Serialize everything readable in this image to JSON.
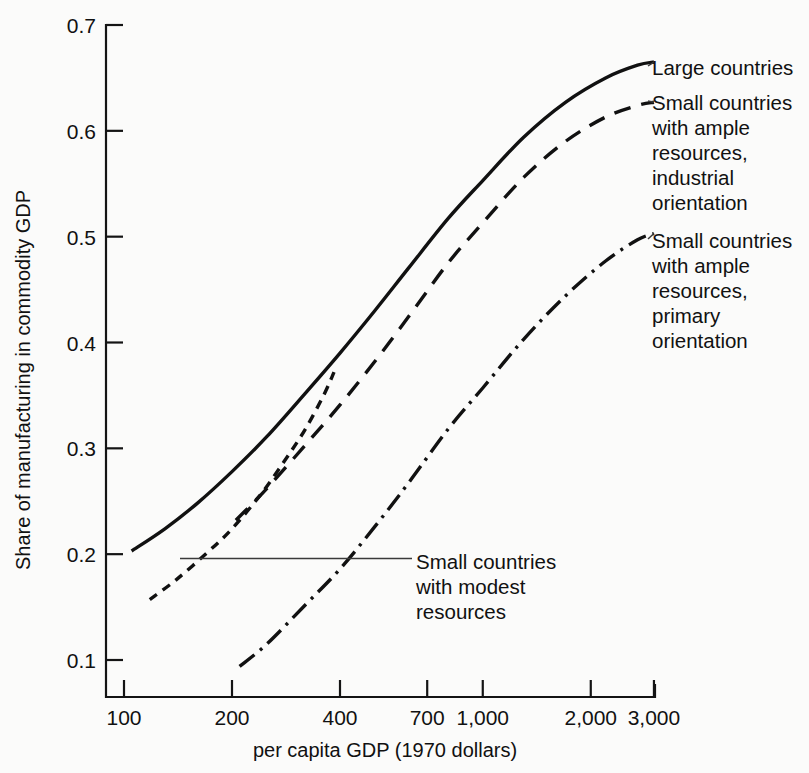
{
  "chart_data": {
    "type": "line",
    "title": "",
    "xlabel": "per capita GDP (1970 dollars)",
    "ylabel": "Share of manufacturing in commodity GDP",
    "xscale": "log",
    "xlim": [
      95,
      3200
    ],
    "ylim": [
      0.07,
      0.715
    ],
    "grid": false,
    "legend_position": "right-inline",
    "xticks": [
      {
        "value": 100,
        "label": "100"
      },
      {
        "value": 200,
        "label": "200"
      },
      {
        "value": 400,
        "label": "400"
      },
      {
        "value": 700,
        "label": "700"
      },
      {
        "value": 1000,
        "label": "1,000"
      },
      {
        "value": 2000,
        "label": "2,000"
      },
      {
        "value": 3000,
        "label": "3,000"
      }
    ],
    "yticks": [
      {
        "value": 0.1,
        "label": "0.1"
      },
      {
        "value": 0.2,
        "label": "0.2"
      },
      {
        "value": 0.3,
        "label": "0.3"
      },
      {
        "value": 0.4,
        "label": "0.4"
      },
      {
        "value": 0.5,
        "label": "0.5"
      },
      {
        "value": 0.6,
        "label": "0.6"
      },
      {
        "value": 0.7,
        "label": "0.7"
      }
    ],
    "series": [
      {
        "name": "Large countries",
        "style": "solid",
        "dasharray": "",
        "x": [
          105,
          130,
          160,
          200,
          250,
          320,
          400,
          500,
          620,
          800,
          1000,
          1300,
          1700,
          2200,
          2700,
          3000
        ],
        "y": [
          0.203,
          0.224,
          0.248,
          0.278,
          0.311,
          0.352,
          0.39,
          0.43,
          0.47,
          0.517,
          0.553,
          0.594,
          0.627,
          0.65,
          0.662,
          0.665
        ]
      },
      {
        "name": "Small countries with ample resources, industrial orientation",
        "style": "long-dash",
        "dasharray": "17 11",
        "x": [
          205,
          250,
          320,
          400,
          500,
          620,
          800,
          1000,
          1300,
          1700,
          2200,
          2700,
          3000
        ],
        "y": [
          0.232,
          0.262,
          0.303,
          0.341,
          0.382,
          0.424,
          0.475,
          0.513,
          0.556,
          0.59,
          0.613,
          0.624,
          0.627
        ]
      },
      {
        "name": "Small countries with modest resources",
        "style": "short-dash",
        "dasharray": "9 7",
        "x": [
          118,
          140,
          170,
          200,
          240,
          280,
          320,
          360,
          385
        ],
        "y": [
          0.157,
          0.176,
          0.201,
          0.224,
          0.256,
          0.288,
          0.318,
          0.35,
          0.372
        ]
      },
      {
        "name": "Small countries with ample resources, primary orientation",
        "style": "dash-dot",
        "dasharray": "19 7 3 7",
        "x": [
          210,
          250,
          320,
          400,
          500,
          620,
          800,
          1000,
          1300,
          1700,
          2200,
          2700,
          3000
        ],
        "y": [
          0.094,
          0.115,
          0.152,
          0.186,
          0.226,
          0.267,
          0.318,
          0.357,
          0.403,
          0.444,
          0.477,
          0.497,
          0.503
        ]
      }
    ],
    "annotations": [
      {
        "name": "large-countries-label",
        "lines": [
          "Large countries"
        ]
      },
      {
        "name": "small-ample-industrial-label",
        "lines": [
          "Small countries",
          "with ample",
          "resources,",
          "industrial",
          "orientation"
        ]
      },
      {
        "name": "small-ample-primary-label",
        "lines": [
          "Small countries",
          "with ample",
          "resources,",
          "primary",
          "orientation"
        ]
      },
      {
        "name": "small-modest-label",
        "lines": [
          "Small countries",
          "with modest",
          "resources"
        ]
      }
    ],
    "colors": {
      "line": "#111111",
      "axis": "#141414",
      "background": "#fbfbfa",
      "leader": "#3a3a3a"
    }
  }
}
